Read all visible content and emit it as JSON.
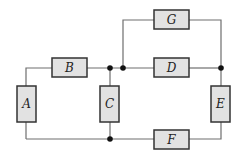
{
  "diagram": {
    "type": "circuit",
    "components": [
      {
        "id": "A",
        "label": "A",
        "orientation": "vertical",
        "x": 17,
        "y": 86,
        "w": 19,
        "h": 36
      },
      {
        "id": "B",
        "label": "B",
        "orientation": "horizontal",
        "x": 52,
        "y": 58,
        "w": 35,
        "h": 19
      },
      {
        "id": "C",
        "label": "C",
        "orientation": "vertical",
        "x": 100,
        "y": 86,
        "w": 19,
        "h": 36
      },
      {
        "id": "D",
        "label": "D",
        "orientation": "horizontal",
        "x": 154,
        "y": 58,
        "w": 35,
        "h": 19
      },
      {
        "id": "E",
        "label": "E",
        "orientation": "vertical",
        "x": 211,
        "y": 86,
        "w": 19,
        "h": 36
      },
      {
        "id": "F",
        "label": "F",
        "orientation": "horizontal",
        "x": 154,
        "y": 130,
        "w": 35,
        "h": 19
      },
      {
        "id": "G",
        "label": "G",
        "orientation": "horizontal",
        "x": 154,
        "y": 10,
        "w": 35,
        "h": 19
      }
    ],
    "junctions": [
      {
        "x": 110,
        "y": 68
      },
      {
        "x": 123,
        "y": 68
      },
      {
        "x": 221,
        "y": 68
      },
      {
        "x": 110,
        "y": 139
      }
    ],
    "colors": {
      "box_fill": "#e2e2e2",
      "box_stroke": "#333333",
      "wire": "#6e6e6e",
      "junction": "#111111"
    }
  }
}
